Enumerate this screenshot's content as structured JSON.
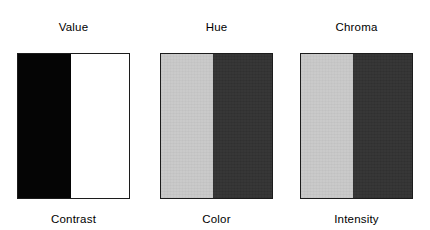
{
  "figure": {
    "background_color": "#ffffff",
    "border_color": "#1c1c1c",
    "panels": [
      {
        "id": "value-contrast",
        "top_label": "Value",
        "bottom_label": "Contrast",
        "left_color": "#050505",
        "right_color": "#ffffff",
        "split_percent": 48,
        "x": 17,
        "y": 48,
        "width": 113,
        "height": 146,
        "textured": false
      },
      {
        "id": "hue-color",
        "top_label": "Hue",
        "bottom_label": "Color",
        "left_color": "#c8c8c8",
        "right_color": "#323232",
        "split_percent": 47,
        "x": 160,
        "y": 48,
        "width": 113,
        "height": 146,
        "textured": true
      },
      {
        "id": "chroma-intensity",
        "top_label": "Chroma",
        "bottom_label": "Intensity",
        "left_color": "#c8c8c8",
        "right_color": "#323232",
        "split_percent": 47,
        "x": 300,
        "y": 48,
        "width": 113,
        "height": 146,
        "textured": true
      }
    ]
  }
}
